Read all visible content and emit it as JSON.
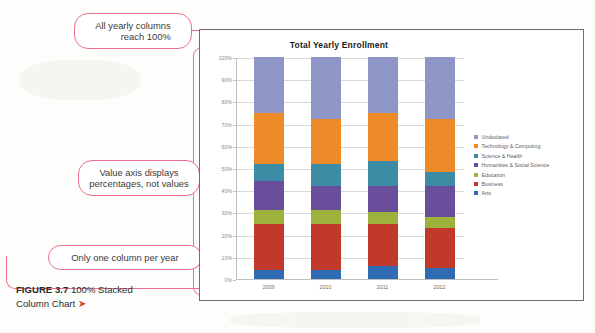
{
  "figure": {
    "caption_bold": "FIGURE 3.7",
    "caption_rest": "100% Stacked",
    "caption_line2": "Column Chart",
    "caption_arrow": "➤"
  },
  "callouts": [
    {
      "id": "callout-1",
      "text": "All yearly columns\nreach 100%"
    },
    {
      "id": "callout-2",
      "text": "Value axis displays\npercentages, not values"
    },
    {
      "id": "callout-3",
      "text": "Only one column per year"
    }
  ],
  "legend": {
    "position": "right",
    "items": [
      {
        "label": "Undeclared",
        "color": "#8d96c6"
      },
      {
        "label": "Technology & Computing",
        "color": "#ed8b28"
      },
      {
        "label": "Science & Health",
        "color": "#3c8ca5"
      },
      {
        "label": "Humanities & Social Science",
        "color": "#6b4e9b"
      },
      {
        "label": "Education",
        "color": "#9cb23c"
      },
      {
        "label": "Business",
        "color": "#c0392b"
      },
      {
        "label": "Arts",
        "color": "#2f6cb5"
      }
    ]
  },
  "chart_data": {
    "type": "bar",
    "stacked": "100%",
    "title": "Total Yearly Enrollment",
    "xlabel": "",
    "ylabel": "",
    "ylim": [
      0,
      100
    ],
    "grid": true,
    "categories": [
      "2009",
      "2010",
      "2011",
      "2012"
    ],
    "ytick_labels": [
      "0%",
      "10%",
      "20%",
      "30%",
      "40%",
      "50%",
      "60%",
      "70%",
      "80%",
      "90%",
      "100%"
    ],
    "ytick_values": [
      0,
      10,
      20,
      30,
      40,
      50,
      60,
      70,
      80,
      90,
      100
    ],
    "series": [
      {
        "name": "Arts",
        "color": "#2f6cb5",
        "values": [
          4,
          4,
          6,
          5
        ]
      },
      {
        "name": "Business",
        "color": "#c0392b",
        "values": [
          21,
          21,
          19,
          18
        ]
      },
      {
        "name": "Education",
        "color": "#9cb23c",
        "values": [
          6,
          6,
          5,
          5
        ]
      },
      {
        "name": "Humanities & Social Science",
        "color": "#6b4e9b",
        "values": [
          13,
          11,
          12,
          14
        ]
      },
      {
        "name": "Science & Health",
        "color": "#3c8ca5",
        "values": [
          8,
          10,
          11,
          6
        ]
      },
      {
        "name": "Technology & Computing",
        "color": "#ed8b28",
        "values": [
          23,
          20,
          22,
          24
        ]
      },
      {
        "name": "Undeclared",
        "color": "#8d96c6",
        "values": [
          25,
          28,
          25,
          28
        ]
      }
    ]
  },
  "colors": {
    "callout_pink": "#ef6e8d",
    "frame": "#6d6e70",
    "grid": "#d9d9d9"
  }
}
